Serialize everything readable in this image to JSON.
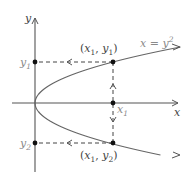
{
  "diagram": {
    "equation_label": {
      "x": "x",
      "eq": " = ",
      "y": "y",
      "exp": "2"
    },
    "axes": {
      "x_label": "x",
      "y_label": "y"
    },
    "points": {
      "top": {
        "open": "(",
        "x": "x",
        "xsub": "1",
        "comma": ", ",
        "y": "y",
        "ysub": "1",
        "close": ")"
      },
      "bottom": {
        "open": "(",
        "x": "x",
        "xsub": "1",
        "comma": ", ",
        "y": "y",
        "ysub": "2",
        "close": ")"
      }
    },
    "tick_labels": {
      "y1": {
        "base": "y",
        "sub": "1"
      },
      "y2": {
        "base": "y",
        "sub": "2"
      },
      "x1": {
        "base": "x",
        "sub": "1"
      }
    }
  }
}
